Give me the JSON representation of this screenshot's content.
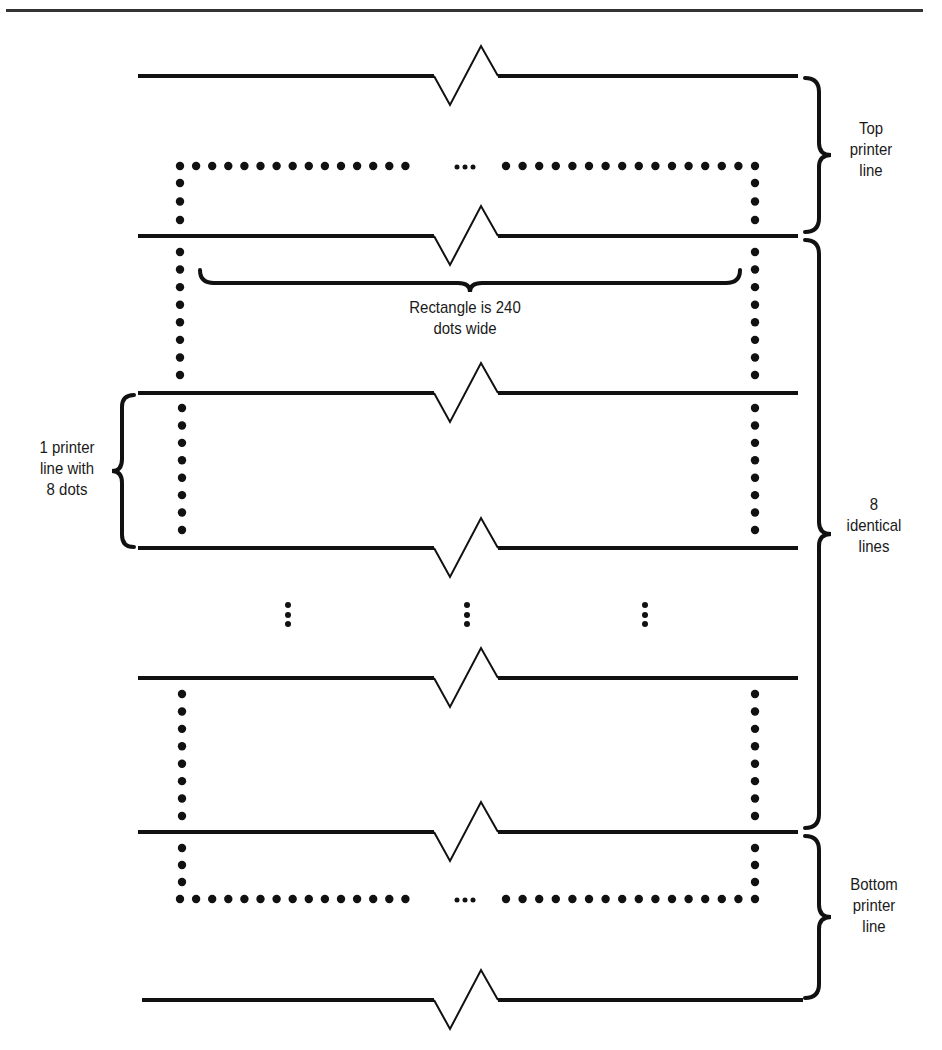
{
  "figure": {
    "title_rule": true,
    "labels": {
      "top_printer_line": [
        "Top",
        "printer",
        "line"
      ],
      "identical_lines": [
        "8",
        "identical",
        "lines"
      ],
      "bottom_printer_line": [
        "Bottom",
        "printer",
        "line"
      ],
      "one_line_eight_dots": [
        "1 printer",
        "line with",
        "8 dots"
      ],
      "rectangle_width": [
        "Rectangle is 240",
        "dots wide"
      ]
    },
    "colors": {
      "ink": "#111111",
      "background": "#ffffff"
    },
    "geometry": {
      "printer_lines_y": [
        76,
        236,
        393,
        548,
        678,
        832,
        1000
      ],
      "line_x_start": 138,
      "line_x_end": 798,
      "rect_left_x": 180,
      "rect_right_x": 755,
      "rect_top_y": 166,
      "rect_bottom_y": 899,
      "dot_spacing": 16.5,
      "vertical_ellipsis_x": [
        288,
        467,
        645
      ],
      "vertical_ellipsis_y": 615
    }
  }
}
